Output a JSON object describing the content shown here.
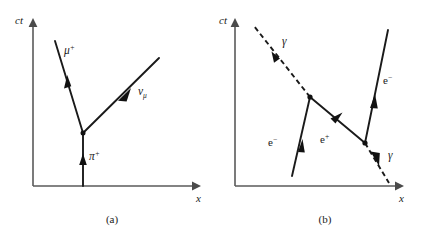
{
  "figure": {
    "background_color": "#ffffff",
    "line_color": "#1a1a1a",
    "axis_color": "#5a5a5a",
    "panels": [
      {
        "id": "a",
        "caption": "(a)",
        "axes": {
          "y_label": "ct",
          "x_label": "x"
        },
        "particles": [
          {
            "name": "muon-plus",
            "label_base": "μ",
            "label_sup": "+",
            "label_sub": "",
            "style": "solid",
            "direction": "up-left"
          },
          {
            "name": "muon-neutrino",
            "label_base": "ν",
            "label_sup": "",
            "label_sub": "μ",
            "style": "solid",
            "direction": "up-right"
          },
          {
            "name": "pion-plus",
            "label_base": "π",
            "label_sup": "+",
            "label_sub": "",
            "style": "solid",
            "direction": "up"
          }
        ],
        "vertex_count": 1
      },
      {
        "id": "b",
        "caption": "(b)",
        "axes": {
          "y_label": "ct",
          "x_label": "x"
        },
        "particles": [
          {
            "name": "photon-incoming",
            "label_base": "γ",
            "label_sup": "",
            "label_sub": "",
            "style": "dashed",
            "direction": "up-left"
          },
          {
            "name": "electron-incoming",
            "label_base": "e",
            "label_sup": "−",
            "label_sub": "",
            "style": "solid",
            "direction": "up-right"
          },
          {
            "name": "positron-internal",
            "label_base": "e",
            "label_sup": "+",
            "label_sub": "",
            "style": "solid",
            "direction": "up-right"
          },
          {
            "name": "electron-outgoing",
            "label_base": "e",
            "label_sup": "−",
            "label_sub": "",
            "style": "solid",
            "direction": "up-right"
          },
          {
            "name": "photon-outgoing",
            "label_base": "γ",
            "label_sup": "",
            "label_sub": "",
            "style": "dashed",
            "direction": "up-left"
          }
        ],
        "vertex_count": 2
      }
    ]
  }
}
